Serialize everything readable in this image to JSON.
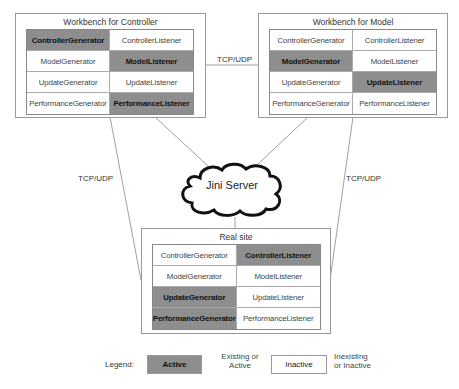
{
  "diagram": {
    "nodes": {
      "controller": {
        "title": "Workbench for Controller",
        "cells": [
          {
            "label": "ControllerGenerator",
            "active": true
          },
          {
            "label": "ControllerListener",
            "active": false
          },
          {
            "label": "ModelGenerator",
            "active": false
          },
          {
            "label": "ModelListener",
            "active": true
          },
          {
            "label": "UpdateGenerator",
            "active": false
          },
          {
            "label": "UpdateListener",
            "active": false
          },
          {
            "label": "PerformanceGenerator",
            "active": false
          },
          {
            "label": "PerformanceListener",
            "active": true
          }
        ]
      },
      "model": {
        "title": "Workbench for Model",
        "cells": [
          {
            "label": "ControllerGenerator",
            "active": false
          },
          {
            "label": "ControllerListener",
            "active": false
          },
          {
            "label": "ModelGenerator",
            "active": true
          },
          {
            "label": "ModelListener",
            "active": false
          },
          {
            "label": "UpdateGenerator",
            "active": false
          },
          {
            "label": "UpdateListener",
            "active": true
          },
          {
            "label": "PerformanceGenerator",
            "active": false
          },
          {
            "label": "PerformanceListener",
            "active": false
          }
        ]
      },
      "realsite": {
        "title": "Real site",
        "cells": [
          {
            "label": "ControllerGenerator",
            "active": false
          },
          {
            "label": "ControllerListener",
            "active": true
          },
          {
            "label": "ModelGenerator",
            "active": false
          },
          {
            "label": "ModelListener",
            "active": false
          },
          {
            "label": "UpdateGenerator",
            "active": true
          },
          {
            "label": "UpdateListener",
            "active": false
          },
          {
            "label": "PerformanceGenerator",
            "active": true
          },
          {
            "label": "PerformanceListener",
            "active": false
          }
        ]
      }
    },
    "server": {
      "label": "Jini Server"
    },
    "edges": {
      "top_label": "TCP/UDP",
      "left_label": "TCP/UDP",
      "right_label": "TCP/UDP"
    },
    "legend": {
      "title": "Legend:",
      "active_label": "Active",
      "active_desc_line1": "Existing or",
      "active_desc_line2": "Active",
      "inactive_label": "Inactive",
      "inactive_desc_line1": "Inexisting",
      "inactive_desc_line2": "or Inactive"
    },
    "colors": {
      "active_fill": "#8e8e8e",
      "inactive_fill": "#ffffff",
      "border": "#9a9a9a"
    }
  }
}
